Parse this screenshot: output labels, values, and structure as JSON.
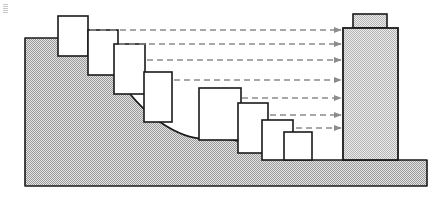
{
  "figure": {
    "width": 447,
    "height": 202,
    "background_color": "#ffffff",
    "outline_color": "#1a1a1a",
    "terrain_fill_color": "#c9c9c9",
    "tower_fill_color": "#d6d6d6",
    "building_fill_color": "#ffffff",
    "arrow_color": "#8c8c8c"
  },
  "terrain": {
    "name": "hillside-ground",
    "description": "Stippled S-curve hillside sloping from upper left down to flat ground at right",
    "crest_y": 38,
    "base_y": 160,
    "bottom_y": 186,
    "left_x": 25,
    "right_x": 427,
    "path": "M 25,186 L 25,38 L 57,38 C 78,38 96,52 112,72 C 128,92 142,110 160,122 C 176,133 190,139 206,139 L 222,139 C 238,139 250,145 264,152 C 276,158 288,160 300,160 L 427,160 L 427,186 Z"
  },
  "buildings": {
    "label": "Stepped terrace buildings",
    "upper_terrace": [
      {
        "name": "building-1",
        "x": 58,
        "y": 16,
        "width": 30,
        "height": 40
      },
      {
        "name": "building-2",
        "x": 88,
        "y": 30,
        "width": 30,
        "height": 45
      },
      {
        "name": "building-3",
        "x": 114,
        "y": 44,
        "width": 31,
        "height": 50
      },
      {
        "name": "building-4",
        "x": 144,
        "y": 72,
        "width": 28,
        "height": 50
      }
    ],
    "lower_terrace": [
      {
        "name": "building-5",
        "x": 199,
        "y": 88,
        "width": 42,
        "height": 52
      },
      {
        "name": "building-6",
        "x": 238,
        "y": 103,
        "width": 30,
        "height": 50
      },
      {
        "name": "building-7",
        "x": 262,
        "y": 120,
        "width": 31,
        "height": 40
      },
      {
        "name": "building-8",
        "x": 284,
        "y": 132,
        "width": 28,
        "height": 28
      }
    ]
  },
  "tower": {
    "name": "tall-tower",
    "body": {
      "x": 343,
      "y": 28,
      "width": 55,
      "height": 132
    },
    "cap": {
      "name": "tower-rooftop-cap",
      "x": 353,
      "y": 14,
      "width": 34,
      "height": 14
    }
  },
  "sightlines": {
    "label": "Dashed view corridor arrows to tower",
    "arrow_target_x": 341,
    "arrows": [
      {
        "name": "sightline-arrow-1",
        "x1": 90,
        "y": 30
      },
      {
        "name": "sightline-arrow-2",
        "x1": 119,
        "y": 44
      },
      {
        "name": "sightline-arrow-3",
        "x1": 147,
        "y": 60
      },
      {
        "name": "sightline-arrow-4",
        "x1": 174,
        "y": 80
      },
      {
        "name": "sightline-arrow-5",
        "x1": 242,
        "y": 98
      },
      {
        "name": "sightline-arrow-6",
        "x1": 270,
        "y": 115
      },
      {
        "name": "sightline-arrow-7",
        "x1": 296,
        "y": 128
      }
    ]
  }
}
